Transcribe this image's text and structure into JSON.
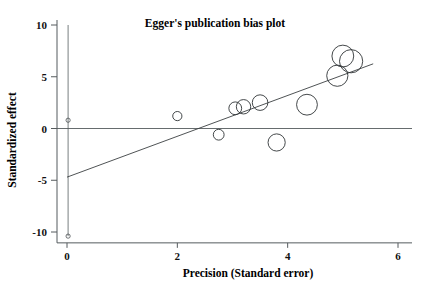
{
  "chart_data": {
    "type": "scatter",
    "title": "Egger's publication bias plot",
    "xlabel": "Precision (Standard error)",
    "ylabel": "Standardized effect",
    "xlim": [
      0,
      6.2
    ],
    "ylim": [
      -11,
      10.5
    ],
    "xticks": [
      0,
      2,
      4,
      6
    ],
    "xtick_labels": [
      "0",
      "2",
      "4",
      "6"
    ],
    "yticks": [
      10,
      5,
      0,
      -5,
      -10
    ],
    "ytick_labels": [
      "10",
      "5",
      "0",
      "-5",
      "-10"
    ],
    "grid": false,
    "legend": false,
    "zero_reference_line": {
      "y": 0,
      "label": "zero-effect-line"
    },
    "regression_line": {
      "x_start": 0.0,
      "y_start": -4.7,
      "x_end": 5.55,
      "y_end": 6.25,
      "intercept": -4.7,
      "slope": 1.973
    },
    "ci_vertical_line": {
      "x": 0.02,
      "y_top": 10.0,
      "y_bottom": -10.4,
      "marker_values": [
        0.8,
        -10.4
      ]
    },
    "points": [
      {
        "x": 2.0,
        "y": 1.2,
        "size": 4.6
      },
      {
        "x": 2.75,
        "y": -0.6,
        "size": 5.4
      },
      {
        "x": 3.05,
        "y": 1.95,
        "size": 6.4
      },
      {
        "x": 3.2,
        "y": 2.1,
        "size": 7.2
      },
      {
        "x": 3.5,
        "y": 2.5,
        "size": 7.8
      },
      {
        "x": 3.8,
        "y": -1.35,
        "size": 8.6
      },
      {
        "x": 4.35,
        "y": 2.3,
        "size": 10.4
      },
      {
        "x": 4.9,
        "y": 5.1,
        "size": 10.6
      },
      {
        "x": 5.0,
        "y": 7.0,
        "size": 10.9
      },
      {
        "x": 5.15,
        "y": 6.5,
        "size": 11.6
      }
    ]
  },
  "figure": {
    "title": "Egger's publication bias plot",
    "x_axis_title": "Precision (Standard error)",
    "y_axis_title": "Standardized effect"
  }
}
